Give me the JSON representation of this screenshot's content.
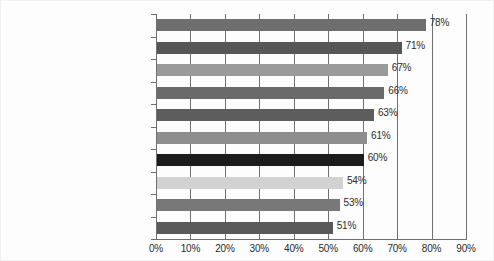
{
  "chart_data": {
    "type": "bar",
    "orientation": "horizontal",
    "title": "",
    "xlabel": "",
    "ylabel": "",
    "xlim": [
      0,
      90
    ],
    "grid": true,
    "legend": "none",
    "value_suffix": "%",
    "xticks": [
      "0%",
      "10%",
      "20%",
      "30%",
      "40%",
      "50%",
      "60%",
      "70%",
      "80%",
      "90%"
    ],
    "xtick_values": [
      0,
      10,
      20,
      30,
      40,
      50,
      60,
      70,
      80,
      90
    ],
    "categories": [
      "Technology",
      "Automotive",
      "Food and Beverage",
      "Consumer Packaged Goods",
      "Telecommunications",
      "Pharmaceuticals",
      "Energy",
      "Financial Services",
      "Banks",
      "Media"
    ],
    "values": [
      78,
      71,
      67,
      66,
      63,
      61,
      60,
      54,
      53,
      51
    ],
    "value_labels": [
      "78%",
      "71%",
      "67%",
      "66%",
      "63%",
      "61%",
      "60%",
      "54%",
      "53%",
      "51%"
    ],
    "bar_colors": [
      "#6e6e6e",
      "#565656",
      "#9a9a9a",
      "#6a6a6a",
      "#5d5d5d",
      "#8e8e8e",
      "#1c1c1c",
      "#d2d2d2",
      "#787878",
      "#5a5a5a"
    ],
    "axis_color": "#6f6f6f",
    "grid_color": "#6f6f6f",
    "text_color": "#1b1b1b",
    "background_color": "#fdfdfd"
  }
}
